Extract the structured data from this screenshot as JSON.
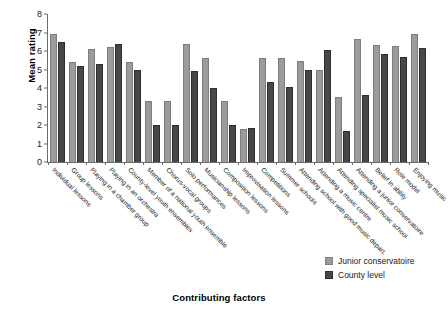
{
  "chart_data": {
    "type": "bar",
    "title": "",
    "xlabel": "Contributing factors",
    "ylabel": "Mean rating",
    "ylim": [
      0,
      8
    ],
    "yticks": [
      0,
      1,
      2,
      3,
      4,
      5,
      6,
      7,
      8
    ],
    "grid": false,
    "legend_position": "bottom-right",
    "categories": [
      "Individual lessons",
      "Group lessons",
      "Playing in a chamber group",
      "Playing in an orchestra",
      "County-level youth ensembles",
      "Member of a national youth ensemble",
      "Chorus-vocal groups",
      "Solo performances",
      "Musicianship lessons",
      "Composition lessons",
      "Improvisation lessons",
      "Competitions",
      "Summer schools",
      "Attending school with good music depart.",
      "Attending a music centre",
      "Attending specialist music school",
      "Attending a junior conservatoire",
      "Belief in ability",
      "Role model",
      "Enjoying music"
    ],
    "series": [
      {
        "name": "Junior conservatoire",
        "color": "#9b9b9b",
        "values": [
          6.9,
          5.4,
          6.1,
          6.2,
          5.4,
          3.3,
          3.3,
          6.4,
          5.6,
          3.3,
          1.8,
          5.6,
          5.6,
          5.45,
          5.0,
          3.5,
          6.65,
          6.35,
          6.25,
          6.9
        ]
      },
      {
        "name": "County level",
        "color": "#474747",
        "values": [
          6.5,
          5.2,
          5.3,
          6.4,
          5.0,
          2.0,
          2.0,
          4.9,
          4.0,
          2.0,
          1.85,
          4.35,
          4.05,
          5.0,
          6.05,
          1.65,
          3.6,
          5.85,
          5.65,
          6.15
        ]
      }
    ]
  },
  "legend": {
    "entries": [
      {
        "label": "Junior conservatoire",
        "swatch": "jc"
      },
      {
        "label": "County level",
        "swatch": "cl"
      }
    ]
  }
}
